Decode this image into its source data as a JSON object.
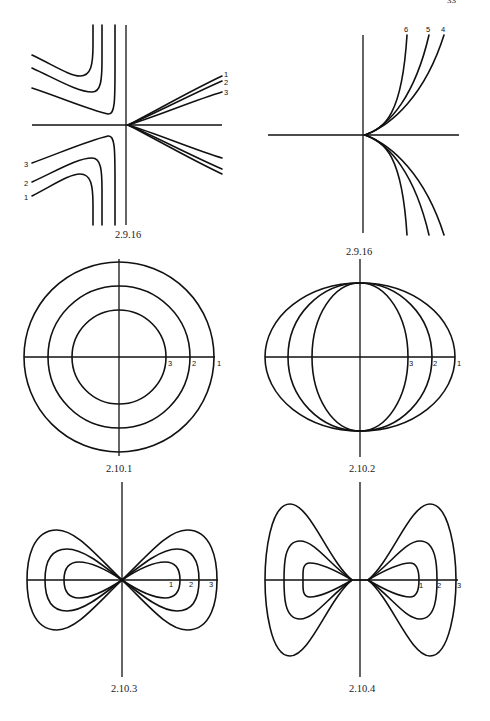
{
  "page": {
    "page_number": "33",
    "ink_color": "#111111",
    "background": "#ffffff"
  },
  "figures": [
    {
      "caption": "2.9.16",
      "type": "hyperbola-family",
      "curve_labels": [
        "1",
        "2",
        "3",
        "3",
        "2",
        "1"
      ]
    },
    {
      "caption": "2.9.16",
      "type": "cusp-family",
      "curve_labels": [
        "6",
        "5",
        "4"
      ]
    },
    {
      "caption": "2.10.1",
      "type": "concentric-circles",
      "curve_labels": [
        "3",
        "2",
        "1"
      ]
    },
    {
      "caption": "2.10.2",
      "type": "nested-ellipses",
      "curve_labels": [
        "3",
        "2",
        "1"
      ]
    },
    {
      "caption": "2.10.3",
      "type": "lemniscate-family",
      "curve_labels": [
        "1",
        "2",
        "3"
      ]
    },
    {
      "caption": "2.10.4",
      "type": "bowtie-family",
      "curve_labels": [
        "1",
        "2",
        "3"
      ]
    }
  ]
}
